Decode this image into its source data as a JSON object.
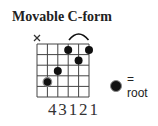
{
  "title": "Movable C-form",
  "diagram": {
    "strings": 6,
    "frets": 5,
    "muted_strings": [
      6
    ],
    "muted_symbol": "×",
    "barre_arc": {
      "from_string": 3,
      "to_string": 1
    },
    "dots": [
      {
        "string": 5,
        "fret": 4,
        "root": true
      },
      {
        "string": 4,
        "fret": 3,
        "root": false
      },
      {
        "string": 3,
        "fret": 1,
        "root": false
      },
      {
        "string": 2,
        "fret": 2,
        "root": false
      },
      {
        "string": 1,
        "fret": 1,
        "root": false
      }
    ],
    "fingering": [
      "4",
      "3",
      "1",
      "2",
      "1"
    ]
  },
  "legend": {
    "label": "= root",
    "icon": "root-dot-icon"
  }
}
